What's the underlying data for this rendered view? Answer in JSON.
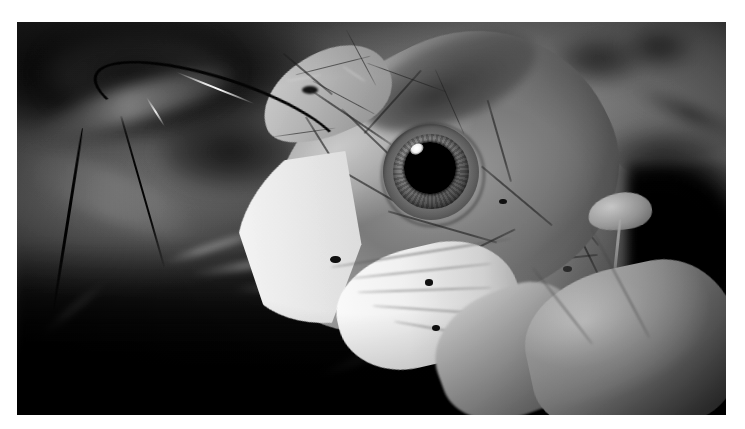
{
  "image": {
    "kind": "photograph",
    "medium": "black-and-white photographic print",
    "width_px": 745,
    "height_px": 429,
    "border": {
      "color": "#ffffff",
      "top_px": 22,
      "left_px": 17,
      "right_px": 19,
      "bottom_px": 14
    },
    "photo": {
      "color_mode": "grayscale",
      "background_color": "#4e4e4e",
      "shadow_color": "#080808",
      "highlight_color": "#f6f4ee"
    }
  },
  "subject": {
    "name": "snake-head",
    "description": "Close-up profile of a snake's head with forked tongue extended, resting among leaf litter",
    "parts": [
      {
        "name": "snout",
        "tone": "light-gray"
      },
      {
        "name": "head-scales",
        "tone": "mid-gray"
      },
      {
        "name": "eye",
        "tone": "dark"
      },
      {
        "name": "supralabial-scales",
        "tone": "bright-white"
      },
      {
        "name": "chin-and-throat",
        "tone": "bright-white"
      },
      {
        "name": "neck",
        "tone": "mid-to-dark-gray"
      },
      {
        "name": "forked-tongue",
        "tone": "black"
      }
    ]
  },
  "eye": {
    "pupil_color": "#060606",
    "iris_color": "#7d7a73",
    "rim_color": "#2a2926",
    "catchlight_color": "#ffffff"
  },
  "scene": {
    "background": "blurred dark forest leaf litter",
    "foreground_objects": [
      {
        "name": "dried-leaf",
        "position": "lower-right"
      },
      {
        "name": "leaf-stem",
        "position": "right"
      },
      {
        "name": "twigs",
        "position": "lower-center"
      }
    ]
  },
  "palette": {
    "white": "#ffffff",
    "highlight": "#f6f4ee",
    "light_gray": "#c2bfb6",
    "mid_gray": "#8b8880",
    "dark_gray": "#3a3a3a",
    "near_black": "#070707"
  }
}
